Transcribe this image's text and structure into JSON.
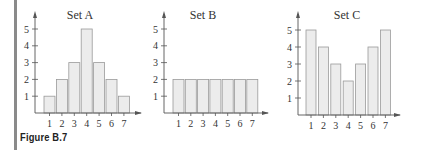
{
  "caption": "Figure B.7",
  "colors": {
    "bar_fill": "#ececec",
    "bar_stroke": "#9a9a9a",
    "axis": "#555555",
    "rule": "#8a8a8a"
  },
  "chart_data": [
    {
      "type": "bar",
      "title": "Set A",
      "categories": [
        "1",
        "2",
        "3",
        "4",
        "5",
        "6",
        "7"
      ],
      "values": [
        1,
        2,
        3,
        5,
        3,
        2,
        1
      ],
      "xlabel": "",
      "ylabel": "",
      "yticks": [
        1,
        2,
        3,
        4,
        5
      ],
      "ylim": [
        0,
        5.6
      ],
      "grid": false
    },
    {
      "type": "bar",
      "title": "Set B",
      "categories": [
        "1",
        "2",
        "3",
        "4",
        "5",
        "6",
        "7"
      ],
      "values": [
        2,
        2,
        2,
        2,
        2,
        2,
        2
      ],
      "xlabel": "",
      "ylabel": "",
      "yticks": [
        1,
        2,
        3,
        4,
        5
      ],
      "ylim": [
        0,
        5.6
      ],
      "grid": false
    },
    {
      "type": "bar",
      "title": "Set C",
      "categories": [
        "1",
        "2",
        "3",
        "4",
        "5",
        "6",
        "7"
      ],
      "values": [
        5,
        4,
        3,
        2,
        3,
        4,
        5
      ],
      "xlabel": "",
      "ylabel": "",
      "yticks": [
        1,
        2,
        3,
        4,
        5
      ],
      "ylim": [
        0,
        5.6
      ],
      "grid": false
    }
  ]
}
